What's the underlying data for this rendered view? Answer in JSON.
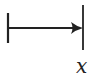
{
  "diagram": {
    "type": "mapsto-arrow",
    "stroke_color": "#222222",
    "label": "x"
  }
}
